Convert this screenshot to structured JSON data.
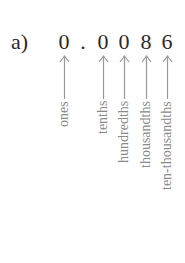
{
  "part": "a)",
  "number": {
    "digits": [
      {
        "char": "0",
        "x": 57,
        "place": "ones",
        "label_height": 44
      },
      {
        "char": ".",
        "x": 76
      },
      {
        "char": "0",
        "x": 96,
        "place": "tenths",
        "label_height": 50
      },
      {
        "char": "0",
        "x": 117,
        "place": "hundredths",
        "label_height": 90
      },
      {
        "char": "8",
        "x": 139,
        "place": "thousandths",
        "label_height": 98
      },
      {
        "char": "6",
        "x": 160,
        "place": "ten-thousandths",
        "label_height": 148
      }
    ]
  },
  "colors": {
    "text": "#2a2a2a",
    "arrow": "#9a9a9a",
    "label": "#8a8a8a"
  }
}
